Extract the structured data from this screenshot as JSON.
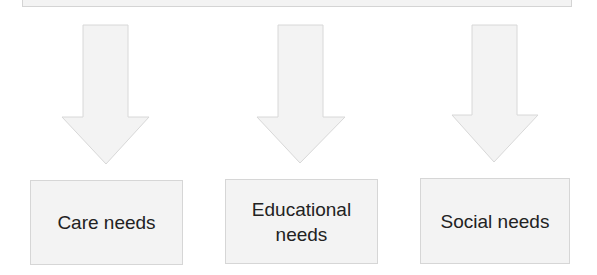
{
  "diagram": {
    "top_box": {
      "label": ""
    },
    "arrows": [
      {
        "name": "arrow-to-care",
        "direction": "down"
      },
      {
        "name": "arrow-to-educational",
        "direction": "down"
      },
      {
        "name": "arrow-to-social",
        "direction": "down"
      }
    ],
    "nodes": [
      {
        "label": "Care needs"
      },
      {
        "label": "Educational\nneeds"
      },
      {
        "label": "Social needs"
      }
    ],
    "colors": {
      "fill": "#f3f3f3",
      "border": "#d4d4d4",
      "text": "#222222"
    }
  }
}
